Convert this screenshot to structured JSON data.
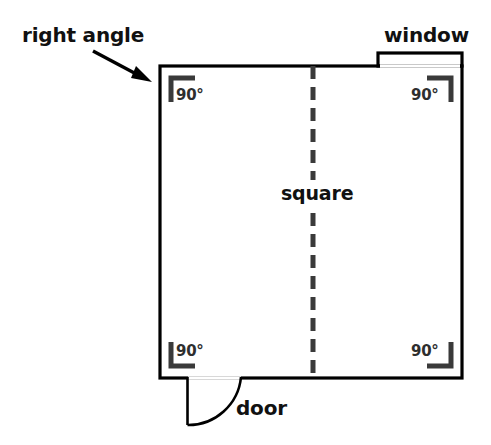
{
  "diagram": {
    "title_labels": {
      "right_angle": "right angle",
      "window": "window",
      "door": "door",
      "square": "square"
    },
    "angle_markers": [
      {
        "position": "top-left",
        "label": "90°"
      },
      {
        "position": "top-right",
        "label": "90°"
      },
      {
        "position": "bottom-left",
        "label": "90°"
      },
      {
        "position": "bottom-right",
        "label": "90°"
      }
    ],
    "colors": {
      "wall": "#000000",
      "angle_marker": "#3a3a3a",
      "dashed_symmetry_line": "#3a3a3a",
      "background": "#ffffff",
      "label_text": "#111111"
    },
    "shapes": {
      "room_outline": "square",
      "symmetry_line": "vertical-dashed",
      "door_swing": "quarter-arc",
      "window_opening": "rectangle-on-top-wall",
      "pointer": "arrow-from-right-angle-label-to-top-left-corner"
    }
  }
}
